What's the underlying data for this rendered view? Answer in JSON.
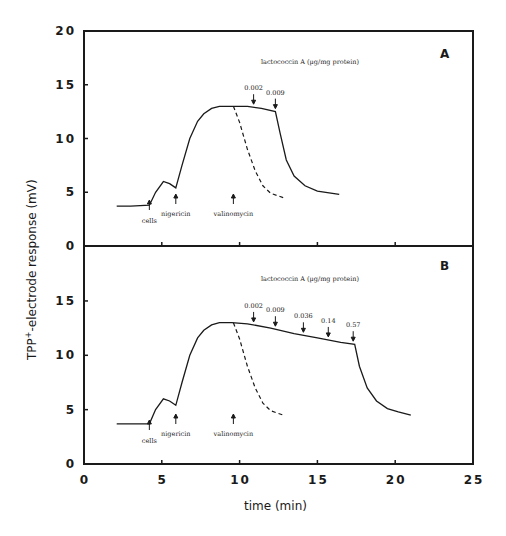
{
  "chart_data": [
    {
      "type": "line",
      "panel": "A",
      "title": "",
      "xlabel": "time (min)",
      "ylabel": "TPP+-electrode response (mV)",
      "xlim": [
        0,
        25
      ],
      "ylim": [
        0,
        20
      ],
      "xticks": [
        0,
        5,
        10,
        15,
        20,
        25
      ],
      "yticks": [
        0,
        5,
        10,
        15,
        20
      ],
      "grid": false,
      "annotation_header": "lactococcin A (µg/mg protein)",
      "series": [
        {
          "name": "lactococcin A",
          "style": "solid",
          "x": [
            2.1,
            3.0,
            4.2,
            4.6,
            5.1,
            5.5,
            5.9,
            6.3,
            6.8,
            7.3,
            7.7,
            8.2,
            8.7,
            9.5,
            10.5,
            11.4,
            12.3,
            12.6,
            13.0,
            13.5,
            14.2,
            15.0,
            16.4
          ],
          "y": [
            3.7,
            3.7,
            3.8,
            5.0,
            6.0,
            5.8,
            5.4,
            7.5,
            10.0,
            11.6,
            12.3,
            12.8,
            13.0,
            13.0,
            13.0,
            12.8,
            12.5,
            10.5,
            8.0,
            6.5,
            5.6,
            5.1,
            4.8
          ]
        },
        {
          "name": "valinomycin control",
          "style": "dashed",
          "x": [
            9.6,
            10.0,
            10.5,
            11.0,
            11.5,
            12.0,
            12.8
          ],
          "y": [
            13.0,
            11.5,
            9.0,
            7.0,
            5.6,
            4.9,
            4.5
          ]
        }
      ],
      "annotations": [
        {
          "text": "cells",
          "x": 4.2,
          "direction": "up"
        },
        {
          "text": "nigericin",
          "x": 5.9,
          "direction": "up"
        },
        {
          "text": "valinomycin",
          "x": 9.6,
          "direction": "up"
        },
        {
          "text": "0.002",
          "x": 10.9,
          "direction": "down"
        },
        {
          "text": "0.009",
          "x": 12.3,
          "direction": "down"
        }
      ]
    },
    {
      "type": "line",
      "panel": "B",
      "title": "",
      "xlabel": "time (min)",
      "ylabel": "TPP+-electrode response (mV)",
      "xlim": [
        0,
        25
      ],
      "ylim": [
        0,
        20
      ],
      "xticks": [
        0,
        5,
        10,
        15,
        20,
        25
      ],
      "yticks": [
        0,
        5,
        10,
        15
      ],
      "grid": false,
      "annotation_header": "lactococcin A (µg/mg protein)",
      "series": [
        {
          "name": "lactococcin A",
          "style": "solid",
          "x": [
            2.1,
            3.0,
            4.2,
            4.6,
            5.1,
            5.5,
            5.9,
            6.3,
            6.8,
            7.3,
            7.7,
            8.2,
            8.7,
            9.5,
            10.5,
            12.0,
            13.5,
            15.0,
            16.5,
            17.4,
            17.7,
            18.2,
            18.8,
            19.5,
            20.2,
            21.0
          ],
          "y": [
            3.7,
            3.7,
            3.7,
            5.0,
            6.0,
            5.8,
            5.4,
            7.5,
            10.0,
            11.6,
            12.3,
            12.8,
            13.0,
            13.0,
            12.9,
            12.5,
            12.0,
            11.6,
            11.2,
            11.0,
            9.0,
            7.0,
            5.8,
            5.1,
            4.8,
            4.5
          ]
        },
        {
          "name": "valinomycin control",
          "style": "dashed",
          "x": [
            9.6,
            10.0,
            10.5,
            11.0,
            11.5,
            12.0,
            12.8
          ],
          "y": [
            13.0,
            11.5,
            9.0,
            7.0,
            5.6,
            4.9,
            4.5
          ]
        }
      ],
      "annotations": [
        {
          "text": "cells",
          "x": 4.2,
          "direction": "up"
        },
        {
          "text": "nigericin",
          "x": 5.9,
          "direction": "up"
        },
        {
          "text": "valinomycin",
          "x": 9.6,
          "direction": "up"
        },
        {
          "text": "0.002",
          "x": 10.9,
          "direction": "down"
        },
        {
          "text": "0.009",
          "x": 12.3,
          "direction": "down"
        },
        {
          "text": "0.036",
          "x": 14.1,
          "direction": "down"
        },
        {
          "text": "0.14",
          "x": 15.7,
          "direction": "down"
        },
        {
          "text": "0.57",
          "x": 17.3,
          "direction": "down"
        }
      ]
    }
  ],
  "labels": {
    "ylabel_main": "-electrode response  (mV)",
    "ylabel_prefix": "TPP",
    "ylabel_sup": "+",
    "xlabel": "time  (min)",
    "panel_a": "A",
    "panel_b": "B",
    "header": "lactococcin  A  (µg/mg  protein)",
    "x_ticks": [
      "0",
      "5",
      "10",
      "15",
      "20",
      "25"
    ],
    "y_ticks_top": [
      "0",
      "5",
      "10",
      "15",
      "20"
    ],
    "y_ticks_bottom": [
      "0",
      "5",
      "10",
      "15"
    ]
  }
}
